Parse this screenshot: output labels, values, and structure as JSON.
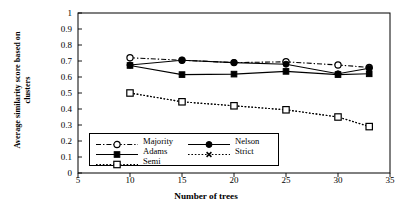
{
  "chart_data": {
    "type": "line",
    "title": "",
    "xlabel": "Number of trees",
    "ylabel": "Average similarity score based on clusters",
    "ylabel_line1": "Average similarity score based on",
    "ylabel_line2": "clusters",
    "xlim": [
      5,
      35
    ],
    "ylim": [
      0,
      1
    ],
    "xticks": [
      5,
      10,
      15,
      20,
      25,
      30,
      35
    ],
    "yticks": [
      0,
      0.1,
      0.2,
      0.3,
      0.4,
      0.5,
      0.6,
      0.7,
      0.8,
      0.9,
      1
    ],
    "ytick_labels": [
      "0",
      "0.1",
      "0.2",
      "0.3",
      "0.4",
      "0.5",
      "0.6",
      "0.7",
      "0.8",
      "0.9",
      "1"
    ],
    "xtick_labels": [
      "5",
      "10",
      "15",
      "20",
      "25",
      "30",
      "35"
    ],
    "grid": false,
    "legend_position": "inside-lower-left",
    "x": [
      10,
      15,
      20,
      25,
      30,
      33
    ],
    "series": [
      {
        "name": "Majority",
        "values": [
          0.72,
          0.705,
          0.69,
          0.695,
          0.675,
          0.66
        ],
        "marker": "open-circle",
        "line": "dash-dot",
        "color": "#000000"
      },
      {
        "name": "Nelson",
        "values": [
          0.675,
          0.705,
          0.69,
          0.68,
          0.62,
          0.655
        ],
        "marker": "filled-circle",
        "line": "solid",
        "color": "#000000"
      },
      {
        "name": "Adams",
        "values": [
          0.672,
          0.615,
          0.618,
          0.635,
          0.615,
          0.62
        ],
        "marker": "filled-square",
        "line": "solid",
        "color": "#000000"
      },
      {
        "name": "Strict",
        "values": [
          0.5,
          0.445,
          0.42,
          0.395,
          0.35,
          0.29
        ],
        "marker": "x-cross",
        "line": "dotted",
        "color": "#000000"
      },
      {
        "name": "Semi",
        "values": [
          0.5,
          0.445,
          0.42,
          0.395,
          0.35,
          0.29
        ],
        "marker": "open-square",
        "line": "dotted",
        "color": "#000000"
      }
    ]
  },
  "legend": {
    "entries": [
      {
        "label": "Majority"
      },
      {
        "label": "Nelson"
      },
      {
        "label": "Adams"
      },
      {
        "label": "Strict"
      },
      {
        "label": "Semi"
      }
    ]
  }
}
